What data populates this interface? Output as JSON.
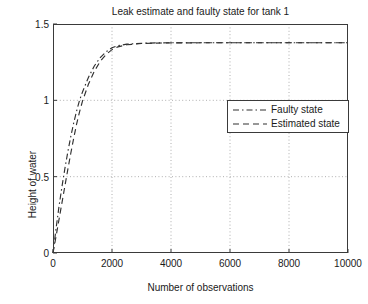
{
  "chart_data": {
    "type": "line",
    "title": "Leak estimate and faulty state for tank 1",
    "xlabel": "Number of observations",
    "ylabel": "Height of water",
    "xlim": [
      0,
      10000
    ],
    "ylim": [
      0,
      1.5
    ],
    "xticks": [
      0,
      2000,
      4000,
      6000,
      8000,
      10000
    ],
    "xticklabels": [
      "0",
      "2000",
      "4000",
      "6000",
      "8000",
      "10000"
    ],
    "yticks": [
      0,
      0.5,
      1,
      1.5
    ],
    "yticklabels": [
      "0",
      "0.5",
      "1",
      "1.5"
    ],
    "grid": true,
    "grid_style": "dotted",
    "legend_position": "center-right",
    "background_color": "#ffffff",
    "axis_color": "#3a3a3a",
    "series": [
      {
        "name": "Faulty state",
        "color": "#303030",
        "linestyle": "dash-dot",
        "x": [
          0,
          100,
          200,
          300,
          400,
          500,
          600,
          700,
          800,
          900,
          1000,
          1200,
          1400,
          1600,
          1800,
          2000,
          2200,
          2500,
          3000,
          3500,
          4000,
          5000,
          6000,
          7000,
          8000,
          9000,
          10000
        ],
        "y": [
          0.0,
          0.155,
          0.3,
          0.43,
          0.55,
          0.66,
          0.76,
          0.85,
          0.93,
          1.0,
          1.055,
          1.15,
          1.225,
          1.28,
          1.318,
          1.345,
          1.358,
          1.368,
          1.374,
          1.376,
          1.377,
          1.377,
          1.377,
          1.377,
          1.377,
          1.377,
          1.377
        ]
      },
      {
        "name": "Estimated state",
        "color": "#303030",
        "linestyle": "dashed",
        "x": [
          0,
          100,
          200,
          300,
          400,
          500,
          600,
          700,
          800,
          900,
          1000,
          1200,
          1400,
          1600,
          1800,
          2000,
          2200,
          2500,
          3000,
          3500,
          4000,
          5000,
          6000,
          7000,
          8000,
          9000,
          10000
        ],
        "y": [
          0.0,
          0.105,
          0.215,
          0.325,
          0.435,
          0.545,
          0.65,
          0.75,
          0.845,
          0.925,
          0.995,
          1.105,
          1.19,
          1.255,
          1.3,
          1.332,
          1.35,
          1.364,
          1.372,
          1.375,
          1.376,
          1.377,
          1.377,
          1.377,
          1.377,
          1.377,
          1.377
        ]
      }
    ]
  },
  "legend": {
    "items": [
      {
        "label": "Faulty state"
      },
      {
        "label": "Estimated state"
      }
    ]
  }
}
